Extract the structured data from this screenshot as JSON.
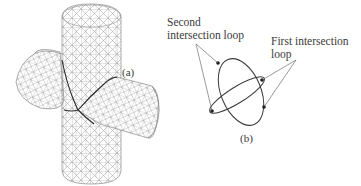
{
  "figure": {
    "panel_a": {
      "label": "(a)",
      "description": "Triangulated mesh of two intersecting cylinders with intersection curve"
    },
    "panel_b": {
      "label": "(b)",
      "annotations": {
        "second_loop": {
          "line1": "Second",
          "line2": "intersection loop"
        },
        "first_loop": {
          "line1": "First intersection",
          "line2": "loop"
        }
      }
    }
  }
}
